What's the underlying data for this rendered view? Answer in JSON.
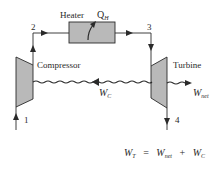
{
  "diagram": {
    "type": "gas-turbine-brayton-cycle-schematic",
    "components": {
      "heater": {
        "label": "Heater",
        "heat_input_label": "Q",
        "heat_input_subscript": "H"
      },
      "compressor": {
        "label": "Compressor"
      },
      "turbine": {
        "label": "Turbine"
      }
    },
    "state_points": [
      "1",
      "2",
      "3",
      "4"
    ],
    "shaft_work": {
      "label": "W",
      "subscript": "C"
    },
    "net_work": {
      "label": "W",
      "subscript": "net"
    },
    "equation": {
      "lhs": "W",
      "lhs_sub": "T",
      "equals": "=",
      "term1": "W",
      "term1_sub": "net",
      "plus": "+",
      "term2": "W",
      "term2_sub": "C"
    },
    "colors": {
      "component_fill": "#b9b9b9",
      "line": "#2a2a2a",
      "background": "#ffffff"
    }
  }
}
